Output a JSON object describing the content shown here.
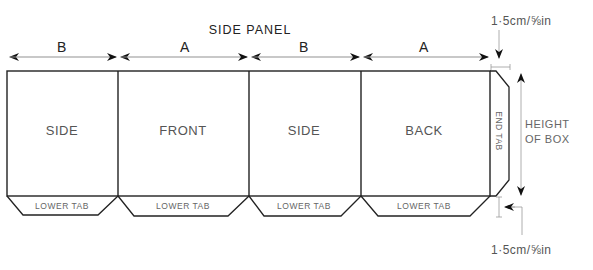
{
  "diagram": {
    "title": "SIDE PANEL",
    "dimensions": {
      "widths": [
        "B",
        "A",
        "B",
        "A"
      ],
      "tab_size_top": "1·5cm/⅝in",
      "tab_size_bottom": "1·5cm/⅝in",
      "height": [
        "HEIGHT",
        "OF BOX"
      ]
    },
    "panels": [
      {
        "label": "SIDE",
        "tab": "LOWER TAB"
      },
      {
        "label": "FRONT",
        "tab": "LOWER TAB"
      },
      {
        "label": "SIDE",
        "tab": "LOWER TAB"
      },
      {
        "label": "BACK",
        "tab": "LOWER TAB"
      }
    ],
    "end_tab": "END TAB",
    "colors": {
      "line": "#222222",
      "text": "#555555",
      "dim_line": "#999999"
    }
  }
}
